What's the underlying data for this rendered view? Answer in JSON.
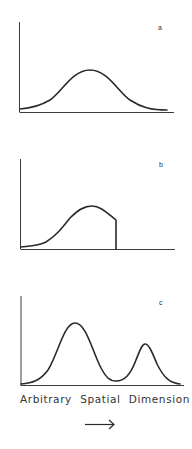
{
  "figure": {
    "panels": [
      {
        "label": "a",
        "description": "Single symmetric Gaussian-like peak"
      },
      {
        "label": "b",
        "description": "Skewed peak truncated abruptly on the right side"
      },
      {
        "label": "c",
        "description": "Bimodal distribution with a larger left peak and smaller right peak"
      }
    ],
    "x_axis_label": [
      "Arbitrary",
      "Spatial",
      "Dimension"
    ],
    "arrow": "right-arrow",
    "colors": {
      "line": "#2a2a2a",
      "background": "#ffffff"
    }
  }
}
